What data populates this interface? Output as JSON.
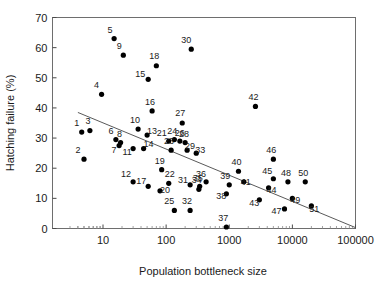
{
  "chart_data": {
    "type": "scatter",
    "title": "",
    "xlabel": "Population bottleneck size",
    "ylabel": "Hatching failure (%)",
    "x_scale": "log",
    "y_scale": "linear",
    "xlim": [
      3,
      100000
    ],
    "ylim": [
      0,
      70
    ],
    "xticks": [
      10,
      100,
      1000,
      10000,
      100000
    ],
    "xtick_labels": [
      "10",
      "100",
      "1000",
      "10000",
      "100000"
    ],
    "yticks": [
      0,
      10,
      20,
      30,
      40,
      50,
      60,
      70
    ],
    "ytick_labels": [
      "0",
      "10",
      "20",
      "30",
      "40",
      "50",
      "60",
      "70"
    ],
    "grid": false,
    "legend": "none",
    "point_labels_shown": true,
    "trendline": {
      "label": "regression line",
      "x_start": 4,
      "y_start": 38.5,
      "x_end": 100000,
      "y_end": 0.3
    },
    "points": [
      {
        "label": "1",
        "x": 4.6,
        "y": 32.0
      },
      {
        "label": "2",
        "x": 5.0,
        "y": 23.0
      },
      {
        "label": "3",
        "x": 6.2,
        "y": 32.5
      },
      {
        "label": "4",
        "x": 9.5,
        "y": 44.5
      },
      {
        "label": "5",
        "x": 15.0,
        "y": 63.0
      },
      {
        "label": "6",
        "x": 16.0,
        "y": 29.5
      },
      {
        "label": "7",
        "x": 18.0,
        "y": 27.5
      },
      {
        "label": "8",
        "x": 19.0,
        "y": 28.5
      },
      {
        "label": "9",
        "x": 21.0,
        "y": 57.5
      },
      {
        "label": "10",
        "x": 36.0,
        "y": 33.0
      },
      {
        "label": "11",
        "x": 30.0,
        "y": 26.5
      },
      {
        "label": "12",
        "x": 30.0,
        "y": 15.5
      },
      {
        "label": "13",
        "x": 50.0,
        "y": 31.0
      },
      {
        "label": "14",
        "x": 44.0,
        "y": 26.5
      },
      {
        "label": "15",
        "x": 52.0,
        "y": 49.5
      },
      {
        "label": "16",
        "x": 60.0,
        "y": 39.0
      },
      {
        "label": "17",
        "x": 52.0,
        "y": 14.0
      },
      {
        "label": "18",
        "x": 70.0,
        "y": 54.0
      },
      {
        "label": "19",
        "x": 85.0,
        "y": 19.5
      },
      {
        "label": "20",
        "x": 80.0,
        "y": 12.5
      },
      {
        "label": "21",
        "x": 110.0,
        "y": 29.0
      },
      {
        "label": "22",
        "x": 110.0,
        "y": 15.0
      },
      {
        "label": "23",
        "x": 120.0,
        "y": 26.0
      },
      {
        "label": "24",
        "x": 135.0,
        "y": 29.5
      },
      {
        "label": "25",
        "x": 135.0,
        "y": 6.0
      },
      {
        "label": "26",
        "x": 165.0,
        "y": 29.0
      },
      {
        "label": "27",
        "x": 180.0,
        "y": 35.0
      },
      {
        "label": "28",
        "x": 200.0,
        "y": 28.5
      },
      {
        "label": "29",
        "x": 215.0,
        "y": 26.0
      },
      {
        "label": "30",
        "x": 250.0,
        "y": 59.5
      },
      {
        "label": "31",
        "x": 240.0,
        "y": 14.5
      },
      {
        "label": "32",
        "x": 240.0,
        "y": 6.0
      },
      {
        "label": "33",
        "x": 300.0,
        "y": 25.0
      },
      {
        "label": "34",
        "x": 330.0,
        "y": 13.0
      },
      {
        "label": "35",
        "x": 340.0,
        "y": 14.0
      },
      {
        "label": "36",
        "x": 430.0,
        "y": 15.5
      },
      {
        "label": "37",
        "x": 900.0,
        "y": 0.5
      },
      {
        "label": "38",
        "x": 900.0,
        "y": 11.5
      },
      {
        "label": "39",
        "x": 1000.0,
        "y": 14.5
      },
      {
        "label": "40",
        "x": 1400.0,
        "y": 19.0
      },
      {
        "label": "41",
        "x": 1700.0,
        "y": 15.5
      },
      {
        "label": "42",
        "x": 2600.0,
        "y": 40.5
      },
      {
        "label": "43",
        "x": 3000.0,
        "y": 9.5
      },
      {
        "label": "44",
        "x": 4200.0,
        "y": 13.5
      },
      {
        "label": "45",
        "x": 5000.0,
        "y": 16.5
      },
      {
        "label": "46",
        "x": 5000.0,
        "y": 23.0
      },
      {
        "label": "47",
        "x": 7500.0,
        "y": 6.5
      },
      {
        "label": "48",
        "x": 8500.0,
        "y": 15.5
      },
      {
        "label": "49",
        "x": 10000.0,
        "y": 10.0
      },
      {
        "label": "50",
        "x": 16000.0,
        "y": 15.5
      },
      {
        "label": "51",
        "x": 20000.0,
        "y": 7.5
      }
    ]
  },
  "axes": {
    "x_title": "Population bottleneck size",
    "y_title": "Hatching failure (%)"
  }
}
